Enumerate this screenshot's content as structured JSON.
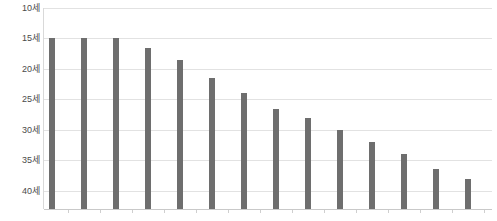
{
  "chart_data": {
    "type": "bar",
    "title": "",
    "subtitle": "",
    "xlabel": "",
    "ylabel": "",
    "categories": [
      "1",
      "2",
      "3",
      "4",
      "5",
      "6",
      "7",
      "8",
      "9",
      "10",
      "11",
      "12",
      "13",
      "14"
    ],
    "values": [
      15,
      15,
      15,
      16.5,
      18.5,
      21.5,
      24,
      26.5,
      28,
      30,
      32,
      34,
      36.5,
      38
    ],
    "value_unit": "세",
    "y_tick_labels": [
      "10세",
      "15세",
      "20세",
      "25세",
      "30세",
      "35세",
      "40세"
    ],
    "y_tick_values": [
      10,
      15,
      20,
      25,
      30,
      35,
      40
    ],
    "ylim": [
      10,
      43
    ],
    "y_axis_inverted": true,
    "x_tick_labels": [
      "",
      "",
      "",
      "",
      "",
      "",
      "",
      "",
      "",
      "",
      "",
      "",
      "",
      ""
    ],
    "grid": true,
    "grid_axis": "y",
    "legend": null,
    "legend_position": "none",
    "bar_color": "#6e6e6e",
    "gridline_color": "#e2e2e2",
    "axis_color": "#c9c9c9",
    "background_color": "#ffffff",
    "tick_label_color": "#4a4a4a"
  }
}
